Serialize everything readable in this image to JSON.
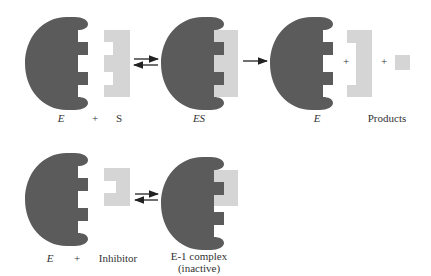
{
  "colors": {
    "enzyme": "#5b5b5b",
    "substrate": "#d5d5d5",
    "arrow": "#222222",
    "text": "#333333"
  },
  "reaction1": {
    "labels": {
      "enzyme": "E",
      "plus": "+",
      "substrate": "S",
      "complex": "ES",
      "enzyme_product": "E",
      "products": "Products"
    },
    "product_plus_1": "+",
    "product_plus_2": "+",
    "arrows": [
      "equilibrium",
      "forward"
    ]
  },
  "reaction2": {
    "labels": {
      "enzyme": "E",
      "plus": "+",
      "inhibitor": "Inhibitor",
      "complex_line1": "E-1 complex",
      "complex_line2": "(inactive)"
    },
    "arrows": [
      "equilibrium"
    ]
  }
}
